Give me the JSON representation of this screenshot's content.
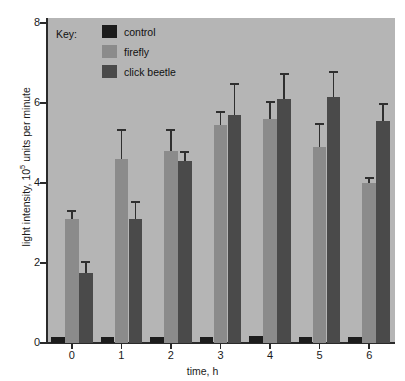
{
  "chart_data": {
    "type": "bar",
    "title": "",
    "xlabel": "time, h",
    "ylabel": "light intensity, 10^5 units per minute",
    "ylabel_prefix": "light intensity, 10",
    "ylabel_sup": "5",
    "ylabel_suffix": " units per minute",
    "categories": [
      "0",
      "1",
      "2",
      "3",
      "4",
      "5",
      "6"
    ],
    "ylim": [
      0,
      8
    ],
    "yticks": [
      0,
      2,
      4,
      6,
      8
    ],
    "ytick_labels": [
      "0",
      "2",
      "4",
      "6",
      "8"
    ],
    "grid": false,
    "legend_position": "inside top-left",
    "series": [
      {
        "name": "control",
        "color": "#1c1c1c",
        "values": [
          0.15,
          0.15,
          0.15,
          0.15,
          0.18,
          0.16,
          0.16
        ],
        "errors": [
          0,
          0,
          0,
          0,
          0,
          0,
          0
        ]
      },
      {
        "name": "firefly",
        "color": "#8b8b8b",
        "values": [
          3.1,
          4.6,
          4.8,
          5.45,
          5.6,
          4.9,
          4.0
        ],
        "errors": [
          0.22,
          0.75,
          0.55,
          0.35,
          0.45,
          0.6,
          0.15
        ]
      },
      {
        "name": "click beetle",
        "color": "#4a4a4a",
        "values": [
          1.75,
          3.1,
          4.55,
          5.7,
          6.1,
          6.15,
          5.55
        ],
        "errors": [
          0.3,
          0.45,
          0.25,
          0.8,
          0.65,
          0.65,
          0.45
        ]
      }
    ]
  },
  "legend": {
    "title": "Key:",
    "entries": [
      {
        "label": "control",
        "color": "#1c1c1c"
      },
      {
        "label": "firefly",
        "color": "#8b8b8b"
      },
      {
        "label": "click beetle",
        "color": "#4a4a4a"
      }
    ]
  },
  "axes": {
    "y_title_prefix": "light intensity, 10",
    "y_title_sup": "5",
    "y_title_suffix": " units per minute",
    "x_title": "time, h"
  },
  "colors": {
    "plot_background": "#b5b5b5",
    "page_background": "#ffffff",
    "axis": "#2a2a2a",
    "control": "#1c1c1c",
    "firefly": "#8b8b8b",
    "click_beetle": "#4a4a4a"
  },
  "caption_sliver": ""
}
